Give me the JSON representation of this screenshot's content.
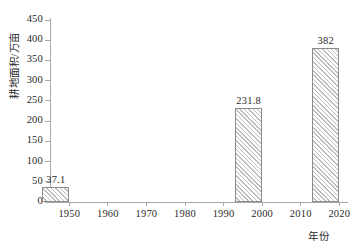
{
  "chart_data": {
    "type": "bar",
    "title": "",
    "xlabel": "年份",
    "ylabel": "耕地面积/万亩",
    "categories": [
      "1950",
      "2000",
      "2020"
    ],
    "values": [
      37.1,
      231.8,
      382
    ],
    "value_labels": [
      "37.1",
      "231.8",
      "382"
    ],
    "xlim": [
      1945,
      2022
    ],
    "ylim": [
      0,
      450
    ],
    "x_ticks": [
      "1950",
      "1960",
      "1970",
      "1980",
      "1990",
      "2000",
      "2010",
      "2020"
    ],
    "y_ticks": [
      "0",
      "50",
      "100",
      "150",
      "200",
      "250",
      "300",
      "350",
      "400",
      "450"
    ],
    "grid": false,
    "legend": "none",
    "bar_style": {
      "fill": "#ffffff",
      "hatch": "forward-diagonal",
      "hatch_color": "#bdbdbd",
      "edge_color": "#8c8c8c"
    },
    "axis_color": "#a8a8a8",
    "text_color": "#2b2b2b"
  }
}
